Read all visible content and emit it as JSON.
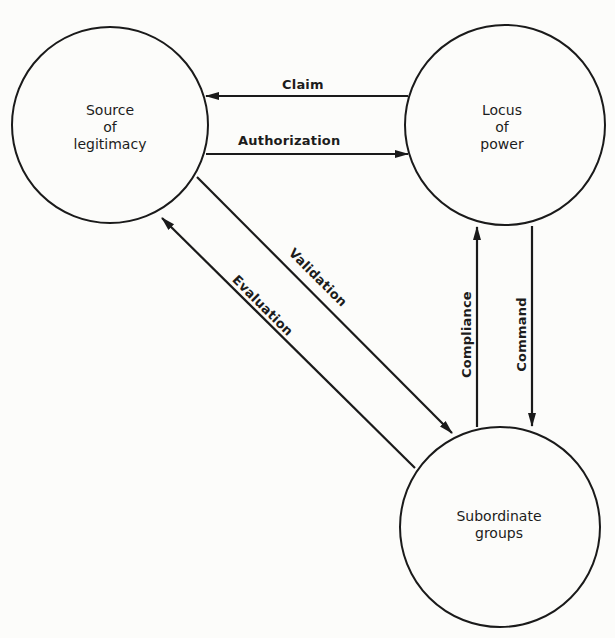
{
  "diagram": {
    "nodes": [
      {
        "id": "source",
        "lines": [
          "Source",
          "of",
          "legitimacy"
        ],
        "cx": 110,
        "cy": 125,
        "r": 98
      },
      {
        "id": "locus",
        "lines": [
          "Locus",
          "of",
          "power"
        ],
        "cx": 505,
        "cy": 125,
        "r": 100
      },
      {
        "id": "subordinate",
        "lines": [
          "Subordinate",
          "groups"
        ],
        "cx": 500,
        "cy": 527,
        "r": 100
      }
    ],
    "edges": [
      {
        "id": "claim",
        "label": "Claim",
        "from": "locus",
        "to": "source"
      },
      {
        "id": "authorization",
        "label": "Authorization",
        "from": "source",
        "to": "locus"
      },
      {
        "id": "validation",
        "label": "Validation",
        "from": "source",
        "to": "subordinate"
      },
      {
        "id": "evaluation",
        "label": "Evaluation",
        "from": "subordinate",
        "to": "source"
      },
      {
        "id": "compliance",
        "label": "Compliance",
        "from": "subordinate",
        "to": "locus"
      },
      {
        "id": "command",
        "label": "Command",
        "from": "locus",
        "to": "subordinate"
      }
    ],
    "colors": {
      "stroke": "#1a1a1a",
      "background": "#fcfcfa"
    }
  }
}
